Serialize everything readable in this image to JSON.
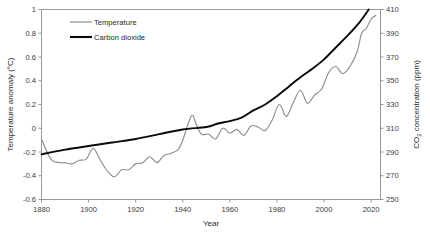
{
  "chart_data": {
    "type": "line",
    "title": "",
    "xlabel": "Year",
    "ylabel": "Temperature anomaly (°C)",
    "y2label": "CO₂ concentration (ppm)",
    "xlim": [
      1880,
      2024
    ],
    "ylim": [
      -0.6,
      1.0
    ],
    "y2lim": [
      250,
      410
    ],
    "grid": false,
    "legend_position": "top-left-inside",
    "x_ticks": [
      1880,
      1900,
      1920,
      1940,
      1960,
      1980,
      2000,
      2020
    ],
    "x_tick_labels": [
      "1880",
      "1900",
      "1920",
      "1940",
      "1960",
      "1980",
      "2000",
      "2020"
    ],
    "y_ticks": [
      -0.6,
      -0.4,
      -0.2,
      0,
      0.2,
      0.4,
      0.6,
      0.8,
      1
    ],
    "y_tick_labels": [
      "-0.6",
      "-0.4",
      "-0.2",
      "0",
      "0.2",
      "0.4",
      "0.6",
      "0.8",
      "1"
    ],
    "y2_ticks": [
      250,
      270,
      290,
      310,
      330,
      350,
      370,
      390,
      410
    ],
    "y2_tick_labels": [
      "250",
      "270",
      "290",
      "310",
      "330",
      "350",
      "370",
      "390",
      "410"
    ],
    "series": [
      {
        "name": "Temperature",
        "axis": "left",
        "color": "#8e8e8e",
        "units": "°C",
        "x": [
          1880,
          1884,
          1888,
          1890,
          1893,
          1896,
          1899,
          1902,
          1905,
          1908,
          1911,
          1914,
          1917,
          1920,
          1923,
          1926,
          1929,
          1932,
          1935,
          1938,
          1940,
          1942,
          1944,
          1946,
          1948,
          1951,
          1954,
          1957,
          1960,
          1963,
          1966,
          1969,
          1972,
          1975,
          1978,
          1981,
          1984,
          1987,
          1990,
          1993,
          1996,
          1999,
          2002,
          2005,
          2008,
          2011,
          2014,
          2016,
          2018,
          2020,
          2022
        ],
        "values": [
          -0.09,
          -0.26,
          -0.29,
          -0.29,
          -0.3,
          -0.27,
          -0.26,
          -0.17,
          -0.27,
          -0.36,
          -0.41,
          -0.35,
          -0.35,
          -0.3,
          -0.29,
          -0.24,
          -0.29,
          -0.23,
          -0.21,
          -0.18,
          -0.1,
          0.02,
          0.11,
          0.02,
          -0.05,
          -0.05,
          -0.09,
          0.0,
          -0.04,
          -0.01,
          -0.06,
          0.02,
          0.01,
          -0.02,
          0.07,
          0.2,
          0.1,
          0.22,
          0.32,
          0.21,
          0.28,
          0.33,
          0.47,
          0.52,
          0.46,
          0.52,
          0.64,
          0.8,
          0.84,
          0.92,
          0.95
        ]
      },
      {
        "name": "Carbon dioxide",
        "axis": "right",
        "color": "#0a0a0a",
        "units": "ppm",
        "x": [
          1880,
          1890,
          1900,
          1910,
          1920,
          1930,
          1940,
          1950,
          1955,
          1960,
          1965,
          1970,
          1975,
          1980,
          1985,
          1990,
          1995,
          2000,
          2005,
          2010,
          2015,
          2019
        ],
        "values": [
          288,
          292,
          295,
          298,
          301,
          305,
          309,
          311,
          314,
          316,
          319,
          325,
          330,
          337,
          345,
          353,
          360,
          368,
          378,
          388,
          399,
          410
        ]
      }
    ]
  },
  "legend": {
    "items": [
      {
        "label": "Temperature",
        "color": "#8e8e8e"
      },
      {
        "label": "Carbon dioxide",
        "color": "#0a0a0a"
      }
    ]
  }
}
